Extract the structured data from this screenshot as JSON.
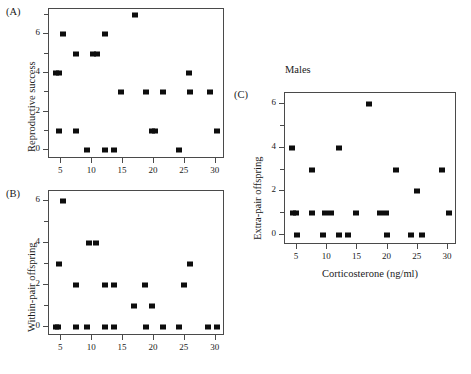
{
  "figure": {
    "panels": [
      {
        "letter": "(A)",
        "title": "",
        "ylabel": "Reproductive success",
        "xlabel": "",
        "xticks": [
          5,
          10,
          15,
          20,
          25,
          30
        ],
        "yticks": [
          0,
          2,
          4,
          6
        ],
        "xlim": [
          3.0,
          31.5
        ],
        "ylim": [
          -0.45,
          7.3
        ],
        "chart_data": {
          "type": "scatter",
          "title": "Reproductive success vs Corticosterone",
          "xlabel": "Corticosterone (ng/ml)",
          "ylabel": "Reproductive success",
          "xlim": [
            3.0,
            31.5
          ],
          "ylim": [
            -0.45,
            7.3
          ],
          "grid": false,
          "points": [
            [
              4.2,
              4
            ],
            [
              4.6,
              4
            ],
            [
              4.6,
              1
            ],
            [
              5.2,
              6
            ],
            [
              7.4,
              5
            ],
            [
              7.4,
              1
            ],
            [
              9.2,
              0
            ],
            [
              10.1,
              5
            ],
            [
              10.8,
              5
            ],
            [
              12.0,
              6
            ],
            [
              12.1,
              0
            ],
            [
              13.5,
              0
            ],
            [
              14.6,
              3
            ],
            [
              17.0,
              7
            ],
            [
              18.7,
              3
            ],
            [
              19.6,
              1
            ],
            [
              20.2,
              1
            ],
            [
              21.5,
              3
            ],
            [
              24.1,
              0
            ],
            [
              25.7,
              4
            ],
            [
              25.9,
              3
            ],
            [
              29.0,
              3
            ],
            [
              30.2,
              1
            ]
          ]
        }
      },
      {
        "letter": "(B)",
        "title": "",
        "ylabel": "Within-pair offspring",
        "xlabel": "",
        "xticks": [
          5,
          10,
          15,
          20,
          25,
          30
        ],
        "yticks": [
          0,
          2,
          4,
          6
        ],
        "xlim": [
          3.0,
          31.5
        ],
        "ylim": [
          -0.45,
          6.5
        ],
        "chart_data": {
          "type": "scatter",
          "title": "Within-pair offspring vs Corticosterone",
          "xlabel": "Corticosterone (ng/ml)",
          "ylabel": "Within-pair offspring",
          "xlim": [
            3.0,
            31.5
          ],
          "ylim": [
            -0.45,
            6.5
          ],
          "grid": false,
          "points": [
            [
              4.2,
              0
            ],
            [
              4.5,
              0
            ],
            [
              4.6,
              3
            ],
            [
              5.2,
              6
            ],
            [
              7.4,
              2
            ],
            [
              7.4,
              0
            ],
            [
              9.2,
              0
            ],
            [
              9.5,
              4
            ],
            [
              10.6,
              4
            ],
            [
              12.0,
              2
            ],
            [
              12.1,
              0
            ],
            [
              13.5,
              0
            ],
            [
              13.6,
              2
            ],
            [
              16.7,
              1
            ],
            [
              18.6,
              2
            ],
            [
              18.7,
              0
            ],
            [
              19.6,
              1
            ],
            [
              21.4,
              0
            ],
            [
              24.0,
              0
            ],
            [
              24.9,
              2
            ],
            [
              25.8,
              3
            ],
            [
              28.7,
              0
            ],
            [
              30.2,
              0
            ]
          ]
        }
      },
      {
        "letter": "(C)",
        "title": "Males",
        "ylabel": "Extra-pair offspring",
        "xlabel": "Corticosterone (ng/ml)",
        "xticks": [
          5,
          10,
          15,
          20,
          25,
          30
        ],
        "yticks": [
          0,
          2,
          4,
          6
        ],
        "xlim": [
          3.0,
          31.5
        ],
        "ylim": [
          -0.45,
          6.5
        ],
        "chart_data": {
          "type": "scatter",
          "title": "Males",
          "xlabel": "Corticosterone (ng/ml)",
          "ylabel": "Extra-pair offspring",
          "xlim": [
            3.0,
            31.5
          ],
          "ylim": [
            -0.45,
            6.5
          ],
          "grid": false,
          "points": [
            [
              4.2,
              4
            ],
            [
              4.3,
              1
            ],
            [
              4.8,
              1
            ],
            [
              5.0,
              0
            ],
            [
              7.4,
              3
            ],
            [
              7.5,
              1
            ],
            [
              9.3,
              0
            ],
            [
              9.7,
              1
            ],
            [
              10.6,
              1
            ],
            [
              12.0,
              4
            ],
            [
              12.0,
              0
            ],
            [
              13.4,
              0
            ],
            [
              14.7,
              1
            ],
            [
              17.0,
              6
            ],
            [
              18.7,
              1
            ],
            [
              19.7,
              1
            ],
            [
              19.9,
              0
            ],
            [
              21.4,
              3
            ],
            [
              23.9,
              0
            ],
            [
              24.8,
              2
            ],
            [
              25.7,
              0
            ],
            [
              29.0,
              3
            ],
            [
              30.2,
              1
            ]
          ]
        }
      }
    ]
  }
}
